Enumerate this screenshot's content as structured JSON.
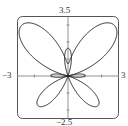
{
  "chart_data": {
    "type": "line",
    "subtype": "polar",
    "title": "",
    "equation": "r = e^(sin θ) − 2cos(4θ)",
    "theta_range": [
      0,
      6.283185
    ],
    "xlim": [
      -3,
      3
    ],
    "ylim": [
      -2.5,
      3.5
    ],
    "grid": false,
    "legend": null,
    "tick_labels": {
      "x_min": "−3",
      "x_max": "3",
      "y_min": "−2.5",
      "y_max": "3.5"
    },
    "colors": {
      "curve": "#222222",
      "frame": "#555555",
      "axis": "#666666"
    }
  }
}
